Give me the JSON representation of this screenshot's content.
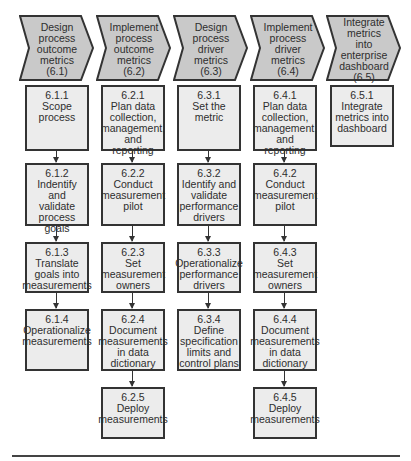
{
  "diagram": {
    "phases": [
      {
        "id": "6.1",
        "lines": [
          "Design",
          "process",
          "outcome",
          "metrics",
          "(6.1)"
        ],
        "steps": [
          {
            "lines": [
              "6.1.1",
              "Scope",
              "process"
            ]
          },
          {
            "lines": [
              "6.1.2",
              "Indentify and",
              "validate",
              "process goals"
            ]
          },
          {
            "lines": [
              "6.1.3",
              "Translate",
              "goals into",
              "measurements"
            ]
          },
          {
            "lines": [
              "6.1.4",
              "Operationalize",
              "measurements"
            ]
          }
        ]
      },
      {
        "id": "6.2",
        "lines": [
          "Implement",
          "process",
          "outcome",
          "metrics",
          "(6.2)"
        ],
        "steps": [
          {
            "lines": [
              "6.2.1",
              "Plan data",
              "collection,",
              "management,",
              "and reporting"
            ]
          },
          {
            "lines": [
              "6.2.2",
              "Conduct",
              "measurement",
              "pilot"
            ]
          },
          {
            "lines": [
              "6.2.3",
              "Set",
              "measurement",
              "owners"
            ]
          },
          {
            "lines": [
              "6.2.4",
              "Document",
              "measurements",
              "in data",
              "dictionary"
            ]
          },
          {
            "lines": [
              "6.2.5",
              "Deploy",
              "measurements"
            ]
          }
        ]
      },
      {
        "id": "6.3",
        "lines": [
          "Design",
          "process",
          "driver",
          "metrics",
          "(6.3)"
        ],
        "steps": [
          {
            "lines": [
              "6.3.1",
              "Set the",
              "metric"
            ]
          },
          {
            "lines": [
              "6.3.2",
              "Identify and",
              "validate",
              "performance",
              "drivers"
            ]
          },
          {
            "lines": [
              "6.3.3",
              "Operationalize",
              "performance",
              "drivers"
            ]
          },
          {
            "lines": [
              "6.3.4",
              "Define",
              "specification",
              "limits and",
              "control plans"
            ]
          }
        ]
      },
      {
        "id": "6.4",
        "lines": [
          "Implement",
          "process",
          "driver",
          "metrics",
          "(6.4)"
        ],
        "steps": [
          {
            "lines": [
              "6.4.1",
              "Plan data",
              "collection,",
              "management,",
              "and reporting"
            ]
          },
          {
            "lines": [
              "6.4.2",
              "Conduct",
              "measurement",
              "pilot"
            ]
          },
          {
            "lines": [
              "6.4.3",
              "Set",
              "measurement",
              "owners"
            ]
          },
          {
            "lines": [
              "6.4.4",
              "Document",
              "measurements",
              "in data",
              "dictionary"
            ]
          },
          {
            "lines": [
              "6.4.5",
              "Deploy",
              "measurements"
            ]
          }
        ]
      },
      {
        "id": "6.5",
        "lines": [
          "Integrate",
          "metrics into",
          "enterprise",
          "dashboard",
          "(6.5)"
        ],
        "steps": [
          {
            "lines": [
              "6.5.1",
              "Integrate",
              "metrics into",
              "dashboard"
            ]
          }
        ]
      }
    ],
    "colors": {
      "chevron_fill": "#c9c9c9",
      "box_fill": "#ececec",
      "stroke": "#333333"
    }
  }
}
